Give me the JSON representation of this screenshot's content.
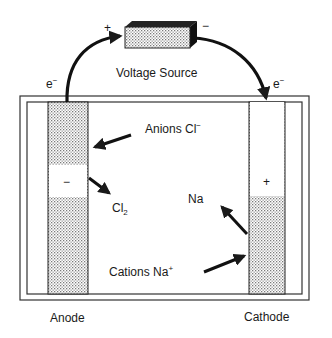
{
  "diagram": {
    "type": "electrolysis-cell",
    "voltage_source": {
      "label": "Voltage Source",
      "positive_terminal": "+",
      "negative_terminal": "−"
    },
    "electron_labels": {
      "left": {
        "base": "e",
        "sup": "−"
      },
      "right": {
        "base": "e",
        "sup": "−"
      }
    },
    "anode": {
      "label": "Anode",
      "sign": "−"
    },
    "cathode": {
      "label": "Cathode",
      "sign": "+"
    },
    "species": {
      "anions": {
        "text": "Anions Cl",
        "sup": "−"
      },
      "chlorine": {
        "base": "Cl",
        "sub": "2"
      },
      "sodium": {
        "text": "Na"
      },
      "cations": {
        "text": "Cations Na",
        "sup": "+"
      }
    },
    "colors": {
      "line": "#1a1a1a",
      "stipple": "#9a9a9a",
      "background": "#ffffff"
    }
  }
}
